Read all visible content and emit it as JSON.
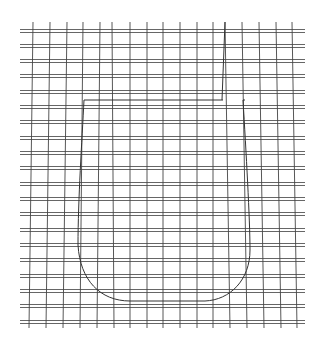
{
  "diagram": {
    "background": "#ffffff",
    "grid": {
      "horizontal_color": "#555555",
      "vertical_color": "#444444",
      "x_start": 20,
      "x_end": 305,
      "y_top": 22,
      "y_bottom": 328,
      "horizontal_rows": [
        31,
        46,
        61,
        76,
        92,
        107,
        122,
        138,
        153,
        168,
        184,
        199,
        214,
        230,
        245,
        260,
        276,
        291,
        306,
        322
      ],
      "double_line_gap": 3,
      "vertical_columns_top": [
        33,
        50,
        67,
        83,
        100,
        112,
        130,
        147,
        163,
        180,
        197,
        213,
        225,
        242,
        259,
        276,
        292
      ],
      "vertical_columns_bottom": [
        29,
        46,
        63,
        80,
        97,
        114,
        130,
        147,
        163,
        180,
        197,
        213,
        230,
        247,
        264,
        281,
        297
      ]
    },
    "cup_outline": {
      "stroke": "#333333",
      "path": "M 84 100 L 223 100 M 243 100 L 245 100 M 84 100 C 82 140 78 200 78 245 C 80 280 100 301 130 301 L 205 301 C 230 300 250 280 250 250 C 250 220 246 150 243 100",
      "thin_line_top": [
        225,
        22
      ],
      "thin_line_bottom": [
        222,
        100
      ]
    }
  }
}
